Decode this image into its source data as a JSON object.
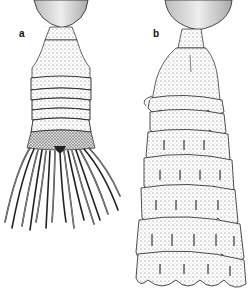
{
  "figure": {
    "panels": [
      {
        "label": "a",
        "subject": "specimen-with-annulated-stalk-and-tentacles"
      },
      {
        "label": "b",
        "subject": "specimen-with-imbricate-lobed-body"
      }
    ],
    "colors": {
      "background": "#ffffff",
      "ink": "#1a1a1a",
      "stipple": "#555555",
      "bulb_fill": "#d9d9d9"
    }
  }
}
